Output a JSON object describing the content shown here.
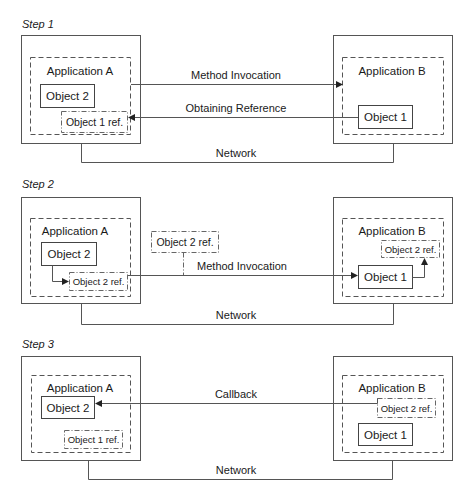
{
  "diagram": {
    "steps": [
      {
        "title": "Step 1",
        "left": {
          "app_label": "Application A",
          "object": "Object 2",
          "ref": "Object 1 ref."
        },
        "right": {
          "app_label": "Application B",
          "object": "Object 1"
        },
        "edges": {
          "top": "Method Invocation",
          "bottom": "Obtaining Reference"
        },
        "network": "Network"
      },
      {
        "title": "Step 2",
        "left": {
          "app_label": "Application A",
          "object": "Object 2",
          "ref": "Object 2 ref."
        },
        "floating_ref": "Object 2 ref.",
        "right": {
          "app_label": "Application B",
          "object": "Object 1",
          "ref": "Object 2 ref."
        },
        "edges": {
          "main": "Method Invocation"
        },
        "network": "Network"
      },
      {
        "title": "Step 3",
        "left": {
          "app_label": "Application A",
          "object": "Object 2",
          "ref": "Object 1 ref."
        },
        "right": {
          "app_label": "Application B",
          "object": "Object 1",
          "ref": "Object 2 ref."
        },
        "edges": {
          "main": "Callback"
        },
        "network": "Network"
      }
    ]
  }
}
